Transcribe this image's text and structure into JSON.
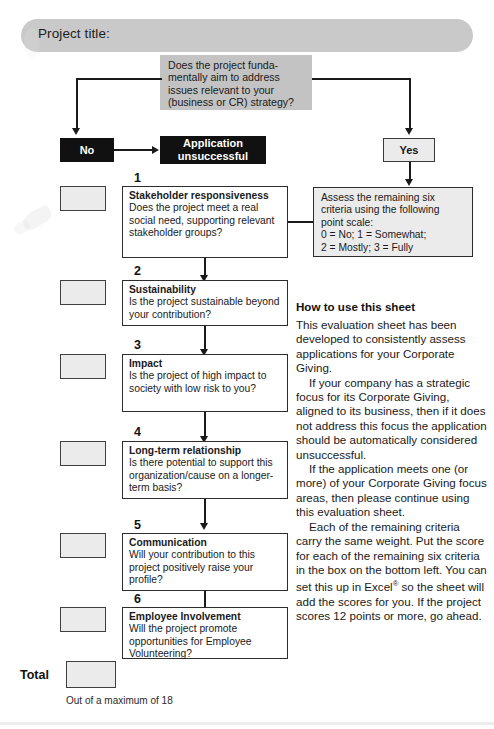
{
  "header": {
    "title_label": "Project title:"
  },
  "flow": {
    "question": "Does the project funda-\nmentally aim to address\nissues relevant to your\n(business or CR) strategy?",
    "no_label": "No",
    "yes_label": "Yes",
    "unsuccessful_label": "Application\nunsuccessful",
    "assess_text": "Assess the remaining six\ncriteria using the following\npoint scale:\n0 = No; 1 = Somewhat;\n2 = Mostly; 3 = Fully"
  },
  "criteria": [
    {
      "number": "1",
      "title": "Stakeholder responsiveness",
      "question": "Does the project meet a real social need, supporting relevant stakeholder groups?",
      "score": ""
    },
    {
      "number": "2",
      "title": "Sustainability",
      "question": "Is the project sustainable beyond your contribution?",
      "score": ""
    },
    {
      "number": "3",
      "title": "Impact",
      "question": "Is the project of high impact to society with low risk to you?",
      "score": ""
    },
    {
      "number": "4",
      "title": "Long-term relationship",
      "question": "Is there potential to support this organization/cause on a longer-term basis?",
      "score": ""
    },
    {
      "number": "5",
      "title": "Communication",
      "question": "Will your contribution to this project positively raise your profile?",
      "score": ""
    },
    {
      "number": "6",
      "title": "Employee Involvement",
      "question": "Will the project promote opportunities for Employee Volunteering?",
      "score": ""
    }
  ],
  "total": {
    "label": "Total",
    "value": "",
    "note": "Out of a maximum of 18"
  },
  "howto": {
    "heading": "How to use this sheet",
    "paragraphs": [
      "This evaluation sheet has been developed to consistently assess applications for your Corporate Giving.",
      "If your company has a strategic focus for its Corporate Giving, aligned to its business, then if it does not address this focus the application should be automatically considered unsuccessful.",
      "If the application meets one (or more) of your Corporate Giving focus areas, then please continue using this evaluation sheet.",
      "Each of the remaining criteria carry the same weight. Put the score for each of the remaining six criteria in the box on the bottom left. You can set this up in Excel® so the sheet will add the scores for you. If the project scores 12 points or more, go ahead."
    ],
    "excel_word": "Excel",
    "excel_mark": "®"
  },
  "colors": {
    "pill": "#c9c9c9",
    "question_box": "#c3c3c3",
    "black_box": "#111111",
    "light_box": "#ebebeb",
    "stroke": "#2d2d2d"
  }
}
